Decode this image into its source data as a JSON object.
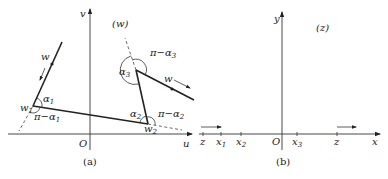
{
  "panel_a": {
    "caption": "(a)",
    "plane_label": "(w)",
    "axes": {
      "horizontal": "u",
      "vertical": "v",
      "origin": "O"
    },
    "vertices": [
      {
        "name": "w",
        "sub": "1",
        "interior_angle": "α",
        "interior_sub": "1",
        "exterior_angle": "π−α",
        "exterior_sub": "1"
      },
      {
        "name": "w",
        "sub": "2",
        "interior_angle": "α",
        "interior_sub": "2",
        "exterior_angle": "π−α",
        "exterior_sub": "2"
      },
      {
        "name": "",
        "sub": "",
        "interior_angle": "α",
        "interior_sub": "3",
        "exterior_angle": "π−α",
        "exterior_sub": "3"
      }
    ],
    "direction_labels": [
      "w",
      "w"
    ]
  },
  "panel_b": {
    "caption": "(b)",
    "plane_label": "(z)",
    "axes": {
      "horizontal": "x",
      "vertical": "y",
      "origin": "O"
    },
    "ticks": [
      {
        "label": "z",
        "sub": ""
      },
      {
        "label": "x",
        "sub": "1"
      },
      {
        "label": "x",
        "sub": "2"
      },
      {
        "label": "x",
        "sub": "3"
      },
      {
        "label": "z",
        "sub": ""
      }
    ]
  }
}
